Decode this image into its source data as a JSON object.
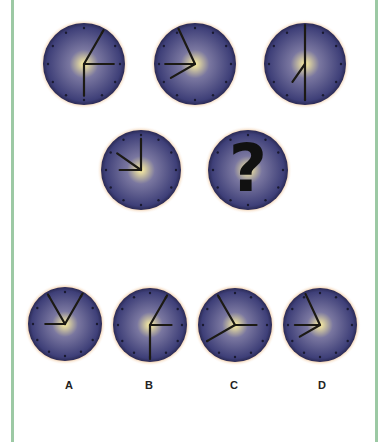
{
  "colors": {
    "frame": "#9cc9a4",
    "face_outer": "#3e3f78",
    "face_mid": "#7a77a0",
    "face_center": "#fff2a0",
    "rim_glow": "#e6a35e",
    "hand": "#1c1a14"
  },
  "puzzle": {
    "sequence": [
      {
        "id": "clock-1",
        "cx": 84,
        "cy": 64,
        "r": 41,
        "hands": [
          {
            "deg": 30,
            "len": 0.98
          },
          {
            "deg": 90,
            "len": 0.75
          },
          {
            "deg": 180,
            "len": 0.8
          }
        ]
      },
      {
        "id": "clock-2",
        "cx": 195,
        "cy": 64,
        "r": 41,
        "hands": [
          {
            "deg": -25,
            "len": 0.98
          },
          {
            "deg": -90,
            "len": 0.75
          },
          {
            "deg": -120,
            "len": 0.7
          }
        ]
      },
      {
        "id": "clock-3",
        "cx": 305,
        "cy": 64,
        "r": 41,
        "hands": [
          {
            "deg": 0,
            "len": 0.98
          },
          {
            "deg": 180,
            "len": 0.9
          },
          {
            "deg": -145,
            "len": 0.55
          }
        ]
      },
      {
        "id": "clock-4",
        "cx": 141,
        "cy": 170,
        "r": 40,
        "hands": [
          {
            "deg": 0,
            "len": 0.8
          },
          {
            "deg": -90,
            "len": 0.55
          },
          {
            "deg": -55,
            "len": 0.75
          }
        ]
      },
      {
        "id": "clock-5",
        "cx": 248,
        "cy": 170,
        "r": 40,
        "unknown": true,
        "symbol": "?"
      }
    ],
    "options": [
      {
        "label": "A",
        "cx": 65,
        "cy": 324,
        "r": 37,
        "label_x": 69,
        "hands": [
          {
            "deg": -30,
            "len": 0.95
          },
          {
            "deg": 30,
            "len": 0.98
          },
          {
            "deg": -90,
            "len": 0.55
          }
        ]
      },
      {
        "label": "B",
        "cx": 150,
        "cy": 325,
        "r": 37,
        "label_x": 149,
        "hands": [
          {
            "deg": 30,
            "len": 0.95
          },
          {
            "deg": 90,
            "len": 0.6
          },
          {
            "deg": 180,
            "len": 0.95
          }
        ]
      },
      {
        "label": "C",
        "cx": 235,
        "cy": 325,
        "r": 37,
        "label_x": 234,
        "hands": [
          {
            "deg": -30,
            "len": 0.95
          },
          {
            "deg": 90,
            "len": 0.6
          },
          {
            "deg": -120,
            "len": 0.9
          }
        ]
      },
      {
        "label": "D",
        "cx": 320,
        "cy": 325,
        "r": 37,
        "label_x": 322,
        "hands": [
          {
            "deg": -25,
            "len": 0.95
          },
          {
            "deg": -90,
            "len": 0.7
          },
          {
            "deg": -120,
            "len": 0.65
          }
        ]
      }
    ]
  },
  "option_labels": {
    "a": "A",
    "b": "B",
    "c": "C",
    "d": "D"
  }
}
